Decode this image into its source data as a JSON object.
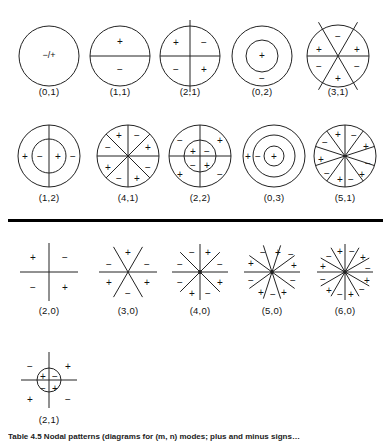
{
  "page": {
    "background_color": "#ffffff",
    "stroke_color": "#222222",
    "divider_color": "#000000"
  },
  "divider": {
    "present": true,
    "y": 219,
    "thickness": 3
  },
  "tail_caption": {
    "text": "Table 4.5 Nodal patterns (diagrams for (m, n) modes; plus and minus signs…",
    "visible_fragment": true
  },
  "rows": [
    {
      "name": "row-1",
      "y": 14,
      "caption_y": 86,
      "figures": [
        {
          "label": "(0,1)",
          "name": "mode-0-1",
          "type": "circle",
          "cx": 49,
          "cy": 42,
          "r": 30,
          "circles": [
            30
          ],
          "diameters": 0,
          "signs": [
            {
              "t": "−/+",
              "x": 0,
              "y": 0
            }
          ]
        },
        {
          "label": "(1,1)",
          "name": "mode-1-1",
          "type": "circle",
          "cx": 120,
          "cy": 42,
          "r": 30,
          "circles": [
            30
          ],
          "diameters": 1,
          "diameter_angles": [
            0
          ],
          "signs": [
            {
              "t": "+",
              "x": 0,
              "y": -14
            },
            {
              "t": "−",
              "x": 0,
              "y": 14
            }
          ]
        },
        {
          "label": "(2,1)",
          "name": "mode-2-1",
          "type": "circle",
          "cx": 190,
          "cy": 42,
          "r": 30,
          "circles": [
            30
          ],
          "diameters": 2,
          "diameter_angles": [
            0,
            90
          ],
          "overshoot_vertical": 6,
          "signs": [
            {
              "t": "+",
              "x": -14,
              "y": -13
            },
            {
              "t": "−",
              "x": 14,
              "y": -13
            },
            {
              "t": "−",
              "x": -14,
              "y": 14
            },
            {
              "t": "+",
              "x": 14,
              "y": 14
            }
          ]
        },
        {
          "label": "(0,2)",
          "name": "mode-0-2",
          "type": "circle",
          "cx": 262,
          "cy": 42,
          "r": 30,
          "circles": [
            30,
            16
          ],
          "diameters": 0,
          "signs": [
            {
              "t": "+",
              "x": 0,
              "y": 0
            },
            {
              "t": "−",
              "x": 0,
              "y": 23
            }
          ]
        },
        {
          "label": "(3,1)",
          "name": "mode-3-1",
          "type": "circle",
          "cx": 338,
          "cy": 42,
          "r": 31,
          "circles": [
            31
          ],
          "diameters": 3,
          "diameter_angles": [
            0,
            60,
            120
          ],
          "diagonal_overshoot": 8,
          "signs": [
            {
              "t": "−",
              "x": 0,
              "y": -19
            },
            {
              "t": "+",
              "x": -19,
              "y": -6
            },
            {
              "t": "+",
              "x": 19,
              "y": -6
            },
            {
              "t": "−",
              "x": -19,
              "y": 11
            },
            {
              "t": "−",
              "x": 19,
              "y": 11
            },
            {
              "t": "+",
              "x": 0,
              "y": 23
            }
          ]
        }
      ]
    },
    {
      "name": "row-2",
      "y": 118,
      "caption_y": 192,
      "figures": [
        {
          "label": "(1,2)",
          "name": "mode-1-2",
          "type": "circle",
          "cx": 49,
          "cy": 38,
          "r": 31,
          "circles": [
            31,
            17
          ],
          "diameters": 1,
          "diameter_angles": [
            90
          ],
          "signs": [
            {
              "t": "+",
              "x": -24,
              "y": 1
            },
            {
              "t": "−",
              "x": -9,
              "y": 1
            },
            {
              "t": "+",
              "x": 9,
              "y": 1
            },
            {
              "t": "−",
              "x": 24,
              "y": 1
            }
          ]
        },
        {
          "label": "(4,1)",
          "name": "mode-4-1",
          "type": "circle",
          "cx": 128,
          "cy": 38,
          "r": 31,
          "circles": [
            31
          ],
          "diameters": 4,
          "diameter_angles": [
            0,
            45,
            90,
            135
          ],
          "signs": [
            {
              "t": "+",
              "x": -9,
              "y": -20
            },
            {
              "t": "−",
              "x": 9,
              "y": -20
            },
            {
              "t": "−",
              "x": -20,
              "y": -8
            },
            {
              "t": "+",
              "x": 20,
              "y": -8
            },
            {
              "t": "+",
              "x": -20,
              "y": 12
            },
            {
              "t": "−",
              "x": 20,
              "y": 12
            },
            {
              "t": "−",
              "x": -9,
              "y": 23
            },
            {
              "t": "+",
              "x": 9,
              "y": 23
            }
          ]
        },
        {
          "label": "(2,2)",
          "name": "mode-2-2",
          "type": "circle",
          "cx": 200,
          "cy": 38,
          "r": 31,
          "circles": [
            31,
            16
          ],
          "diameters": 2,
          "diameter_angles": [
            0,
            90
          ],
          "signs": [
            {
              "t": "−",
              "x": -20,
              "y": -15
            },
            {
              "t": "+",
              "x": 20,
              "y": -15
            },
            {
              "t": "+",
              "x": -7,
              "y": -4
            },
            {
              "t": "−",
              "x": 7,
              "y": -4
            },
            {
              "t": "−",
              "x": -7,
              "y": 10
            },
            {
              "t": "+",
              "x": 7,
              "y": 10
            },
            {
              "t": "+",
              "x": -20,
              "y": 19
            },
            {
              "t": "−",
              "x": 20,
              "y": 19
            }
          ]
        },
        {
          "label": "(0,3)",
          "name": "mode-0-3",
          "type": "circle",
          "cx": 274,
          "cy": 38,
          "r": 31,
          "circles": [
            31,
            21,
            10
          ],
          "diameters": 0,
          "signs": [
            {
              "t": "+",
              "x": 0,
              "y": 1
            },
            {
              "t": "−",
              "x": -16,
              "y": 1
            },
            {
              "t": "+",
              "x": -26,
              "y": 1
            }
          ]
        },
        {
          "label": "(5,1)",
          "name": "mode-5-1",
          "type": "circle",
          "cx": 345,
          "cy": 38,
          "r": 31,
          "circles": [
            31
          ],
          "diameters": 5,
          "diameter_angles": [
            90,
            126,
            162,
            18,
            54
          ],
          "signs": [
            {
              "t": "+",
              "x": -7,
              "y": -21
            },
            {
              "t": "−",
              "x": 9,
              "y": -20
            },
            {
              "t": "−",
              "x": -20,
              "y": -13
            },
            {
              "t": "+",
              "x": 21,
              "y": -9
            },
            {
              "t": "+",
              "x": -24,
              "y": 4
            },
            {
              "t": "−",
              "x": 23,
              "y": 8
            },
            {
              "t": "−",
              "x": -18,
              "y": 18
            },
            {
              "t": "+",
              "x": 17,
              "y": 19
            },
            {
              "t": "+",
              "x": -5,
              "y": 24
            },
            {
              "t": "−",
              "x": 6,
              "y": 24
            }
          ]
        }
      ]
    },
    {
      "name": "row-3",
      "y": 240,
      "caption_y": 305,
      "figures": [
        {
          "label": "(2,0)",
          "name": "mode-2-0",
          "type": "lines",
          "cx": 49,
          "cy": 32,
          "r": 29,
          "line_angles": [
            0,
            90
          ],
          "signs": [
            {
              "t": "+",
              "x": -16,
              "y": -14
            },
            {
              "t": "−",
              "x": 16,
              "y": -14
            },
            {
              "t": "−",
              "x": -16,
              "y": 16
            },
            {
              "t": "+",
              "x": 16,
              "y": 16
            }
          ]
        },
        {
          "label": "(3,0)",
          "name": "mode-3-0",
          "type": "lines",
          "cx": 128,
          "cy": 32,
          "r": 29,
          "line_angles": [
            0,
            60,
            120
          ],
          "signs": [
            {
              "t": "+",
              "x": 0,
              "y": -19
            },
            {
              "t": "−",
              "x": -19,
              "y": -7
            },
            {
              "t": "−",
              "x": 19,
              "y": -7
            },
            {
              "t": "+",
              "x": -19,
              "y": 11
            },
            {
              "t": "+",
              "x": 19,
              "y": 11
            },
            {
              "t": "−",
              "x": 0,
              "y": 22
            }
          ]
        },
        {
          "label": "(4,0)",
          "name": "mode-4-0",
          "type": "lines",
          "cx": 200,
          "cy": 32,
          "r": 28,
          "line_angles": [
            0,
            45,
            90,
            135
          ],
          "signs": [
            {
              "t": "−",
              "x": -8,
              "y": -19
            },
            {
              "t": "+",
              "x": 8,
              "y": -19
            },
            {
              "t": "−",
              "x": -20,
              "y": -7
            },
            {
              "t": "−",
              "x": 20,
              "y": -7
            },
            {
              "t": "−",
              "x": -20,
              "y": 11
            },
            {
              "t": "+",
              "x": 20,
              "y": 11
            },
            {
              "t": "+",
              "x": -8,
              "y": 22
            },
            {
              "t": "−",
              "x": 8,
              "y": 22
            }
          ]
        },
        {
          "label": "(5,0)",
          "name": "mode-5-0",
          "type": "lines",
          "cx": 272,
          "cy": 32,
          "r": 28,
          "line_angles": [
            0,
            36,
            72,
            108,
            144
          ],
          "signs": [
            {
              "t": "−",
              "x": -9,
              "y": -19
            },
            {
              "t": "+",
              "x": 6,
              "y": -19
            },
            {
              "t": "−",
              "x": 19,
              "y": -17
            },
            {
              "t": "+",
              "x": -21,
              "y": -8
            },
            {
              "t": "+",
              "x": 22,
              "y": -6
            },
            {
              "t": "−",
              "x": -21,
              "y": 9
            },
            {
              "t": "−",
              "x": 21,
              "y": 9
            },
            {
              "t": "+",
              "x": -11,
              "y": 21
            },
            {
              "t": "−",
              "x": 1,
              "y": 23
            },
            {
              "t": "+",
              "x": 12,
              "y": 21
            }
          ]
        },
        {
          "label": "(6,0)",
          "name": "mode-6-0",
          "type": "lines",
          "cx": 345,
          "cy": 32,
          "r": 28,
          "line_angles": [
            0,
            30,
            60,
            90,
            120,
            150
          ],
          "signs": [
            {
              "t": "+",
              "x": -5,
              "y": -20
            },
            {
              "t": "−",
              "x": 7,
              "y": -20
            },
            {
              "t": "−",
              "x": -16,
              "y": -15
            },
            {
              "t": "+",
              "x": 18,
              "y": -14
            },
            {
              "t": "+",
              "x": -22,
              "y": -5
            },
            {
              "t": "−",
              "x": 23,
              "y": -3
            },
            {
              "t": "−",
              "x": -22,
              "y": 8
            },
            {
              "t": "+",
              "x": 22,
              "y": 9
            },
            {
              "t": "+",
              "x": -16,
              "y": 19
            },
            {
              "t": "−",
              "x": 17,
              "y": 18
            },
            {
              "t": "−",
              "x": -5,
              "y": 23
            },
            {
              "t": "+",
              "x": 6,
              "y": 23
            }
          ]
        }
      ]
    },
    {
      "name": "row-4",
      "y": 352,
      "caption_y": 414,
      "figures": [
        {
          "label": "(2,1)",
          "name": "mode-2-1-b",
          "type": "circle-lines",
          "cx": 49,
          "cy": 28,
          "r": 12,
          "line_half_len": 28,
          "circles": [
            12
          ],
          "line_angles": [
            0,
            90
          ],
          "signs": [
            {
              "t": "−",
              "x": -19,
              "y": -13
            },
            {
              "t": "+",
              "x": 19,
              "y": -13
            },
            {
              "t": "+",
              "x": -6,
              "y": -3
            },
            {
              "t": "−",
              "x": 6,
              "y": -3
            },
            {
              "t": "−",
              "x": -6,
              "y": 9
            },
            {
              "t": "+",
              "x": 6,
              "y": 9
            },
            {
              "t": "+",
              "x": -19,
              "y": 20
            },
            {
              "t": "−",
              "x": 19,
              "y": 20
            }
          ]
        }
      ]
    }
  ]
}
